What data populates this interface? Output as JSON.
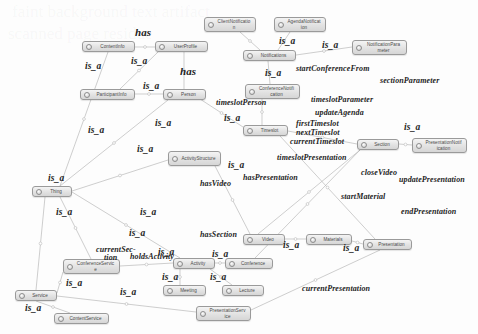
{
  "diagram": {
    "type": "ontology-graph",
    "colors": {
      "node_border": "#9a9a9a",
      "node_fill_top": "#f4f4f4",
      "node_fill_bottom": "#d6d6d6",
      "node_text": "#4a4a4a",
      "edge_line": "#b9b9b9",
      "edge_label": "#1d1d1d",
      "background": "#fdfdfd"
    },
    "nodes": [
      {
        "id": "clientNotification",
        "label": "ClientNotification",
        "x": 204,
        "y": 17,
        "w": 52,
        "h": 15
      },
      {
        "id": "agendaNotification",
        "label": "AgendaNotification",
        "x": 274,
        "y": 17,
        "w": 52,
        "h": 15
      },
      {
        "id": "contentInfo",
        "label": "ContentInfo",
        "x": 82,
        "y": 41,
        "w": 53,
        "h": 11
      },
      {
        "id": "userProfile",
        "label": "UserProfile",
        "x": 155,
        "y": 41,
        "w": 53,
        "h": 11
      },
      {
        "id": "notifications",
        "label": "Notifications",
        "x": 243,
        "y": 50,
        "w": 53,
        "h": 11
      },
      {
        "id": "notificationParameter",
        "label": "NotificationParameter",
        "x": 352,
        "y": 40,
        "w": 55,
        "h": 15
      },
      {
        "id": "conferenceNotification",
        "label": "ConferenceNotification",
        "x": 245,
        "y": 84,
        "w": 55,
        "h": 15
      },
      {
        "id": "participantInfo",
        "label": "ParticipantInfo",
        "x": 80,
        "y": 89,
        "w": 55,
        "h": 11
      },
      {
        "id": "person",
        "label": "Person",
        "x": 163,
        "y": 89,
        "w": 43,
        "h": 11
      },
      {
        "id": "timeslot",
        "label": "Timeslot",
        "x": 243,
        "y": 125,
        "w": 45,
        "h": 11
      },
      {
        "id": "section",
        "label": "Section",
        "x": 357,
        "y": 139,
        "w": 42,
        "h": 11
      },
      {
        "id": "presentationNotification",
        "label": "PresentationNotification",
        "x": 412,
        "y": 138,
        "w": 55,
        "h": 15
      },
      {
        "id": "activityStructure",
        "label": "ActivityStructure",
        "x": 168,
        "y": 151,
        "w": 53,
        "h": 15
      },
      {
        "id": "thing",
        "label": "Thing",
        "x": 32,
        "y": 186,
        "w": 40,
        "h": 11
      },
      {
        "id": "video",
        "label": "Video",
        "x": 243,
        "y": 234,
        "w": 42,
        "h": 11
      },
      {
        "id": "materials",
        "label": "Materials",
        "x": 306,
        "y": 234,
        "w": 46,
        "h": 11
      },
      {
        "id": "presentation",
        "label": "Presentation",
        "x": 363,
        "y": 239,
        "w": 49,
        "h": 11
      },
      {
        "id": "conferenceService",
        "label": "ConferenceService",
        "x": 63,
        "y": 259,
        "w": 57,
        "h": 15
      },
      {
        "id": "activity",
        "label": "Activity",
        "x": 173,
        "y": 258,
        "w": 42,
        "h": 11
      },
      {
        "id": "conference",
        "label": "Conference",
        "x": 225,
        "y": 258,
        "w": 48,
        "h": 11
      },
      {
        "id": "service",
        "label": "Service",
        "x": 15,
        "y": 290,
        "w": 42,
        "h": 11
      },
      {
        "id": "meeting",
        "label": "Meeting",
        "x": 163,
        "y": 285,
        "w": 43,
        "h": 11
      },
      {
        "id": "lecture",
        "label": "Lecture",
        "x": 222,
        "y": 285,
        "w": 42,
        "h": 11
      },
      {
        "id": "contentService",
        "label": "ContentService",
        "x": 54,
        "y": 313,
        "w": 55,
        "h": 11
      },
      {
        "id": "presentationService",
        "label": "PresentationService",
        "x": 196,
        "y": 306,
        "w": 55,
        "h": 15
      }
    ],
    "edge_labels": [
      {
        "id": "has-top",
        "text": "has",
        "x": 135,
        "y": 26,
        "kind": "has"
      },
      {
        "id": "isa-1",
        "text": "is_a",
        "x": 85,
        "y": 61,
        "kind": "isa"
      },
      {
        "id": "isa-2",
        "text": "is_a",
        "x": 131,
        "y": 56,
        "kind": "isa"
      },
      {
        "id": "isa-3",
        "text": "is_a",
        "x": 279,
        "y": 36,
        "kind": "isa"
      },
      {
        "id": "isa-4",
        "text": "is_a",
        "x": 322,
        "y": 40,
        "kind": "isa"
      },
      {
        "id": "has-mid",
        "text": "has",
        "x": 180,
        "y": 65,
        "kind": "has"
      },
      {
        "id": "isa-5",
        "text": "is_a",
        "x": 143,
        "y": 81,
        "kind": "isa"
      },
      {
        "id": "isa-6",
        "text": "is_a",
        "x": 265,
        "y": 68,
        "kind": "isa"
      },
      {
        "id": "startConferenceFrom",
        "text": "startConferenceFrom",
        "x": 296,
        "y": 64,
        "kind": "rel"
      },
      {
        "id": "sectionParameter",
        "text": "sectionParameter",
        "x": 380,
        "y": 76,
        "kind": "rel"
      },
      {
        "id": "timeslotPerson",
        "text": "timeslotPerson",
        "x": 216,
        "y": 98,
        "kind": "rel"
      },
      {
        "id": "timeslotParameter",
        "text": "timeslotParameter",
        "x": 311,
        "y": 95,
        "kind": "rel"
      },
      {
        "id": "updateAgenda",
        "text": "updateAgenda",
        "x": 315,
        "y": 108,
        "kind": "rel"
      },
      {
        "id": "isa-7",
        "text": "is_a",
        "x": 88,
        "y": 125,
        "kind": "isa"
      },
      {
        "id": "isa-8",
        "text": "is_a",
        "x": 155,
        "y": 118,
        "kind": "isa"
      },
      {
        "id": "isa-9",
        "text": "is_a",
        "x": 224,
        "y": 113,
        "kind": "isa"
      },
      {
        "id": "firstTimeslot",
        "text": "firstTimeslot",
        "x": 296,
        "y": 119,
        "kind": "rel"
      },
      {
        "id": "nextTimeslot",
        "text": "nextTimeslot",
        "x": 296,
        "y": 128,
        "kind": "rel"
      },
      {
        "id": "currentTimeslot",
        "text": "currentTimeslot",
        "x": 290,
        "y": 137,
        "kind": "rel"
      },
      {
        "id": "isa-10",
        "text": "is_a",
        "x": 404,
        "y": 122,
        "kind": "isa"
      },
      {
        "id": "timeslotPresentation",
        "text": "timeslotPresentation",
        "x": 277,
        "y": 153,
        "kind": "rel"
      },
      {
        "id": "closeVideo",
        "text": "closeVideo",
        "x": 361,
        "y": 168,
        "kind": "rel"
      },
      {
        "id": "updatePresentation",
        "text": "updatePresentation",
        "x": 399,
        "y": 175,
        "kind": "rel"
      },
      {
        "id": "isa-11",
        "text": "is_a",
        "x": 228,
        "y": 160,
        "kind": "isa"
      },
      {
        "id": "hasVideo",
        "text": "hasVideo",
        "x": 200,
        "y": 179,
        "kind": "rel"
      },
      {
        "id": "hasPresentation",
        "text": "hasPresentation",
        "x": 243,
        "y": 173,
        "kind": "rel"
      },
      {
        "id": "isa-12",
        "text": "is_a",
        "x": 48,
        "y": 173,
        "kind": "isa"
      },
      {
        "id": "isa-13",
        "text": "is_a",
        "x": 137,
        "y": 144,
        "kind": "isa"
      },
      {
        "id": "isa-14",
        "text": "is_a",
        "x": 56,
        "y": 207,
        "kind": "isa"
      },
      {
        "id": "isa-15",
        "text": "is_a",
        "x": 140,
        "y": 207,
        "kind": "isa"
      },
      {
        "id": "startMaterial",
        "text": "startMaterial",
        "x": 341,
        "y": 192,
        "kind": "rel"
      },
      {
        "id": "endPresentation",
        "text": "endPresentation",
        "x": 401,
        "y": 207,
        "kind": "rel"
      },
      {
        "id": "isa-16",
        "text": "is_a",
        "x": 129,
        "y": 228,
        "kind": "isa"
      },
      {
        "id": "hasSection",
        "text": "hasSection",
        "x": 200,
        "y": 230,
        "kind": "rel"
      },
      {
        "id": "isa-17",
        "text": "is_a",
        "x": 283,
        "y": 240,
        "kind": "isa"
      },
      {
        "id": "isa-18",
        "text": "is_a",
        "x": 343,
        "y": 243,
        "kind": "isa"
      },
      {
        "id": "currentSection",
        "text": "currentSec-",
        "x": 96,
        "y": 245,
        "kind": "rel"
      },
      {
        "id": "currentSection2",
        "text": "tion",
        "x": 104,
        "y": 253,
        "kind": "rel"
      },
      {
        "id": "holdsActivity",
        "text": "holdsActivity",
        "x": 130,
        "y": 252,
        "kind": "rel"
      },
      {
        "id": "isa-19",
        "text": "is_a",
        "x": 158,
        "y": 247,
        "kind": "isa"
      },
      {
        "id": "isa-20",
        "text": "is_a",
        "x": 212,
        "y": 249,
        "kind": "isa"
      },
      {
        "id": "isa-21",
        "text": "is_a",
        "x": 66,
        "y": 278,
        "kind": "isa"
      },
      {
        "id": "isa-22",
        "text": "is_a",
        "x": 162,
        "y": 272,
        "kind": "isa"
      },
      {
        "id": "isa-23",
        "text": "is_a",
        "x": 210,
        "y": 272,
        "kind": "isa"
      },
      {
        "id": "isa-24",
        "text": "is_a",
        "x": 120,
        "y": 287,
        "kind": "isa"
      },
      {
        "id": "isa-25",
        "text": "is_a",
        "x": 25,
        "y": 303,
        "kind": "isa"
      },
      {
        "id": "currentPresentation",
        "text": "currentPresentation",
        "x": 302,
        "y": 284,
        "kind": "rel"
      }
    ],
    "edges": [
      {
        "from": "contentInfo",
        "to": "userProfile",
        "x1": 135,
        "y1": 47,
        "x2": 155,
        "y2": 47
      },
      {
        "from": "contentInfo",
        "to": "thing",
        "x1": 108,
        "y1": 52,
        "x2": 60,
        "y2": 186
      },
      {
        "from": "userProfile",
        "to": "participantInfo",
        "x1": 158,
        "y1": 52,
        "x2": 120,
        "y2": 89
      },
      {
        "from": "userProfile",
        "to": "person",
        "x1": 184,
        "y1": 52,
        "x2": 184,
        "y2": 89
      },
      {
        "from": "participantInfo",
        "to": "person",
        "x1": 135,
        "y1": 94,
        "x2": 163,
        "y2": 94
      },
      {
        "from": "clientNotification",
        "to": "notifications",
        "x1": 240,
        "y1": 32,
        "x2": 260,
        "y2": 50
      },
      {
        "from": "agendaNotification",
        "to": "notifications",
        "x1": 290,
        "y1": 32,
        "x2": 278,
        "y2": 50
      },
      {
        "from": "notifications",
        "to": "notificationParameter",
        "x1": 296,
        "y1": 55,
        "x2": 352,
        "y2": 47
      },
      {
        "from": "notifications",
        "to": "conferenceNotification",
        "x1": 268,
        "y1": 61,
        "x2": 270,
        "y2": 84
      },
      {
        "from": "conferenceNotification",
        "to": "timeslot",
        "x1": 262,
        "y1": 99,
        "x2": 262,
        "y2": 125
      },
      {
        "from": "person",
        "to": "timeslot",
        "x1": 200,
        "y1": 99,
        "x2": 243,
        "y2": 127
      },
      {
        "from": "person",
        "to": "thing",
        "x1": 168,
        "y1": 100,
        "x2": 60,
        "y2": 186
      },
      {
        "from": "timeslot",
        "to": "section",
        "x1": 288,
        "y1": 131,
        "x2": 357,
        "y2": 144
      },
      {
        "from": "section",
        "to": "presentationNotification",
        "x1": 399,
        "y1": 144,
        "x2": 412,
        "y2": 145
      },
      {
        "from": "activityStructure",
        "to": "thing",
        "x1": 168,
        "y1": 160,
        "x2": 72,
        "y2": 191
      },
      {
        "from": "thing",
        "to": "service",
        "x1": 45,
        "y1": 197,
        "x2": 36,
        "y2": 290
      },
      {
        "from": "thing",
        "to": "conferenceService",
        "x1": 60,
        "y1": 197,
        "x2": 91,
        "y2": 259
      },
      {
        "from": "thing",
        "to": "activity",
        "x1": 72,
        "y1": 192,
        "x2": 180,
        "y2": 258
      },
      {
        "from": "service",
        "to": "contentService",
        "x1": 36,
        "y1": 301,
        "x2": 70,
        "y2": 313
      },
      {
        "from": "service",
        "to": "conferenceService",
        "x1": 57,
        "y1": 293,
        "x2": 63,
        "y2": 272
      },
      {
        "from": "service",
        "to": "presentationService",
        "x1": 57,
        "y1": 296,
        "x2": 196,
        "y2": 312
      },
      {
        "from": "conferenceService",
        "to": "activity",
        "x1": 120,
        "y1": 266,
        "x2": 173,
        "y2": 263
      },
      {
        "from": "activity",
        "to": "conference",
        "x1": 215,
        "y1": 263,
        "x2": 225,
        "y2": 263
      },
      {
        "from": "activity",
        "to": "meeting",
        "x1": 180,
        "y1": 269,
        "x2": 180,
        "y2": 285
      },
      {
        "from": "activity",
        "to": "lecture",
        "x1": 210,
        "y1": 269,
        "x2": 232,
        "y2": 285
      },
      {
        "from": "video",
        "to": "materials",
        "x1": 285,
        "y1": 239,
        "x2": 306,
        "y2": 239
      },
      {
        "from": "materials",
        "to": "presentation",
        "x1": 352,
        "y1": 241,
        "x2": 363,
        "y2": 244
      },
      {
        "from": "activityStructure",
        "to": "video",
        "x1": 215,
        "y1": 166,
        "x2": 250,
        "y2": 234
      },
      {
        "from": "conference",
        "to": "section",
        "x1": 255,
        "y1": 258,
        "x2": 360,
        "y2": 150
      },
      {
        "from": "timeslot",
        "to": "presentation",
        "x1": 280,
        "y1": 136,
        "x2": 375,
        "y2": 239
      },
      {
        "from": "presentationService",
        "to": "presentation",
        "x1": 251,
        "y1": 310,
        "x2": 380,
        "y2": 250
      },
      {
        "from": "section",
        "to": "video",
        "x1": 360,
        "y1": 150,
        "x2": 258,
        "y2": 234
      }
    ],
    "watermark_lines": [
      {
        "id": "wm-1",
        "text": "faint background text artifact",
        "x": 12,
        "y": 4
      },
      {
        "id": "wm-2",
        "text": "scanned page residue",
        "x": 8,
        "y": 26
      }
    ]
  }
}
